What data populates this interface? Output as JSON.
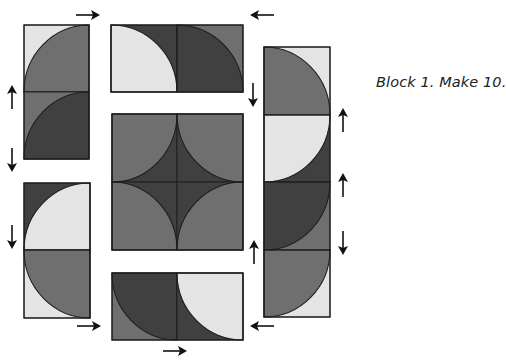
{
  "caption": "Block 1. Make 10.",
  "colors": {
    "light": "#e4e4e4",
    "medium": "#6f6f6f",
    "dark": "#404040",
    "outline": "#1e1e1e",
    "arrow": "#111111"
  },
  "units": [
    {
      "name": "left-top-unit-1",
      "x": 24,
      "y": 25,
      "w": 65,
      "h": 67,
      "bg": "light",
      "fill": "medium",
      "corner": "br"
    },
    {
      "name": "left-top-unit-2",
      "x": 24,
      "y": 92,
      "w": 65,
      "h": 67,
      "bg": "medium",
      "fill": "dark",
      "corner": "br"
    },
    {
      "name": "top-middle-unit-1",
      "x": 111,
      "y": 25,
      "w": 66,
      "h": 67,
      "bg": "dark",
      "fill": "light",
      "corner": "bl"
    },
    {
      "name": "top-middle-unit-2",
      "x": 177,
      "y": 25,
      "w": 66,
      "h": 67,
      "bg": "medium",
      "fill": "dark",
      "corner": "bl"
    },
    {
      "name": "center-unit-1",
      "x": 112,
      "y": 114,
      "w": 65,
      "h": 68,
      "bg": "dark",
      "fill": "medium",
      "corner": "tl"
    },
    {
      "name": "center-unit-2",
      "x": 177,
      "y": 114,
      "w": 66,
      "h": 68,
      "bg": "dark",
      "fill": "medium",
      "corner": "tr"
    },
    {
      "name": "center-unit-3",
      "x": 112,
      "y": 182,
      "w": 65,
      "h": 68,
      "bg": "dark",
      "fill": "medium",
      "corner": "bl"
    },
    {
      "name": "center-unit-4",
      "x": 177,
      "y": 182,
      "w": 66,
      "h": 68,
      "bg": "dark",
      "fill": "medium",
      "corner": "br"
    },
    {
      "name": "bottom-middle-unit-1",
      "x": 112,
      "y": 273,
      "w": 65,
      "h": 67,
      "bg": "medium",
      "fill": "dark",
      "corner": "tr"
    },
    {
      "name": "bottom-middle-unit-2",
      "x": 177,
      "y": 273,
      "w": 66,
      "h": 67,
      "bg": "dark",
      "fill": "light",
      "corner": "tr"
    },
    {
      "name": "left-bottom-unit-1",
      "x": 24,
      "y": 183,
      "w": 66,
      "h": 67,
      "bg": "dark",
      "fill": "light",
      "corner": "br"
    },
    {
      "name": "left-bottom-unit-2",
      "x": 24,
      "y": 250,
      "w": 66,
      "h": 68,
      "bg": "light",
      "fill": "medium",
      "corner": "tr"
    },
    {
      "name": "right-unit-1",
      "x": 264,
      "y": 47,
      "w": 66,
      "h": 68,
      "bg": "light",
      "fill": "medium",
      "corner": "bl"
    },
    {
      "name": "right-unit-2",
      "x": 264,
      "y": 115,
      "w": 66,
      "h": 67,
      "bg": "dark",
      "fill": "light",
      "corner": "tl"
    },
    {
      "name": "right-unit-3",
      "x": 264,
      "y": 182,
      "w": 66,
      "h": 68,
      "bg": "medium",
      "fill": "dark",
      "corner": "tl"
    },
    {
      "name": "right-unit-4",
      "x": 264,
      "y": 250,
      "w": 66,
      "h": 67,
      "bg": "light",
      "fill": "medium",
      "corner": "tl"
    }
  ],
  "outlines": [
    {
      "name": "left-top-column",
      "x": 24,
      "y": 25,
      "w": 65,
      "h": 134
    },
    {
      "name": "top-middle-row",
      "x": 111,
      "y": 25,
      "w": 132,
      "h": 67
    },
    {
      "name": "center-square",
      "x": 112,
      "y": 114,
      "w": 131,
      "h": 136
    },
    {
      "name": "bottom-middle-row",
      "x": 112,
      "y": 273,
      "w": 131,
      "h": 67
    },
    {
      "name": "left-bottom-column",
      "x": 24,
      "y": 183,
      "w": 66,
      "h": 135
    },
    {
      "name": "right-column",
      "x": 264,
      "y": 47,
      "w": 66,
      "h": 270
    }
  ],
  "arrows": [
    {
      "name": "arrow-right-top-left",
      "x": 88,
      "y": 15,
      "dir": "right"
    },
    {
      "name": "arrow-left-top-right",
      "x": 262,
      "y": 15,
      "dir": "left"
    },
    {
      "name": "arrow-up-left-1",
      "x": 12,
      "y": 97,
      "dir": "up"
    },
    {
      "name": "arrow-down-left-1",
      "x": 12,
      "y": 160,
      "dir": "down"
    },
    {
      "name": "arrow-down-left-2",
      "x": 12,
      "y": 237,
      "dir": "down"
    },
    {
      "name": "arrow-down-mid-right",
      "x": 253,
      "y": 95,
      "dir": "down"
    },
    {
      "name": "arrow-up-mid-right",
      "x": 254,
      "y": 252,
      "dir": "up"
    },
    {
      "name": "arrow-up-right-1",
      "x": 343,
      "y": 120,
      "dir": "up"
    },
    {
      "name": "arrow-up-right-2",
      "x": 343,
      "y": 185,
      "dir": "up"
    },
    {
      "name": "arrow-down-right-3",
      "x": 343,
      "y": 243,
      "dir": "down"
    },
    {
      "name": "arrow-right-bottom-left",
      "x": 89,
      "y": 326,
      "dir": "right"
    },
    {
      "name": "arrow-left-bottom-right",
      "x": 262,
      "y": 326,
      "dir": "left"
    },
    {
      "name": "arrow-right-bottom-center",
      "x": 175,
      "y": 351,
      "dir": "right"
    }
  ]
}
